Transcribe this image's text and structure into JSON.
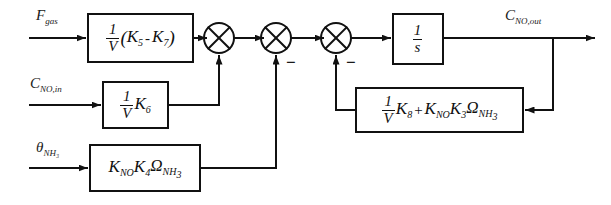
{
  "diagram": {
    "type": "block-diagram",
    "line_color": "#111111",
    "background": "#ffffff",
    "inputs": [
      {
        "id": "f-gas",
        "label": "F",
        "sub": "gas",
        "y": 38
      },
      {
        "id": "c-no-in",
        "label": "C",
        "sub": "NO,in",
        "y": 105
      },
      {
        "id": "theta-nh3",
        "label": "θ",
        "sub": "NH₃",
        "y": 168
      }
    ],
    "outputs": [
      {
        "id": "c-no-out",
        "label": "C",
        "sub": "NO,out",
        "y": 38
      }
    ],
    "blocks": [
      {
        "id": "block-gas-gain",
        "name": "gas-flow-gain-block",
        "expression": "(1/V)(K₅ - K₇)",
        "frac_num": "1",
        "frac_den": "V",
        "tail": "(K₅ - K₇)",
        "x": 88,
        "y": 14,
        "w": 105,
        "h": 48
      },
      {
        "id": "block-no-in-gain",
        "name": "no-inlet-gain-block",
        "expression": "(1/V)K₆",
        "frac_num": "1",
        "frac_den": "V",
        "tail": "K₆",
        "x": 103,
        "y": 82,
        "w": 65,
        "h": 46
      },
      {
        "id": "block-nh3-gain",
        "name": "ammonia-coverage-gain-block",
        "expression": "KₙₒK₄Ωₙₕ₃",
        "tail": "K_NO K₄ Ω_NH₃",
        "x": 90,
        "y": 145,
        "w": 110,
        "h": 46
      },
      {
        "id": "block-integrator",
        "name": "integrator-block",
        "expression": "1/s",
        "frac_num": "1",
        "frac_den": "s",
        "x": 393,
        "y": 14,
        "w": 50,
        "h": 50
      },
      {
        "id": "block-feedback",
        "name": "feedback-gain-block",
        "expression": "(1/V)K₈ + KₙₒK₃Ωₙₕ₃",
        "frac_num": "1",
        "frac_den": "V",
        "tail": "K₈ + K_NO K₃ Ω_NH₃",
        "x": 356,
        "y": 88,
        "w": 167,
        "h": 44
      }
    ],
    "summing_junctions": [
      {
        "id": "sum-1",
        "name": "summing-junction-1",
        "cx": 219,
        "cy": 38,
        "r": 15,
        "bottom_sign": ""
      },
      {
        "id": "sum-2",
        "name": "summing-junction-2",
        "cx": 276,
        "cy": 38,
        "r": 15,
        "bottom_sign": "−"
      },
      {
        "id": "sum-3",
        "name": "summing-junction-3",
        "cx": 336,
        "cy": 38,
        "r": 15,
        "bottom_sign": "−"
      }
    ],
    "signs": [
      {
        "id": "minus-sum2",
        "text": "−",
        "x": 286,
        "y": 57
      },
      {
        "id": "minus-sum3",
        "text": "−",
        "x": 346,
        "y": 57
      }
    ]
  }
}
